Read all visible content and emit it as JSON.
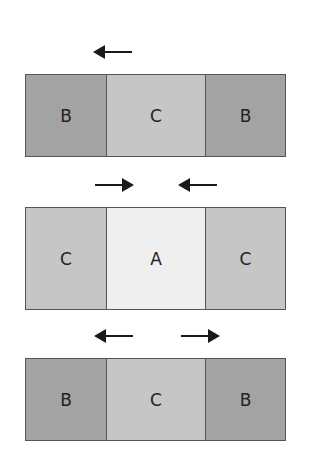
{
  "diagram": {
    "colors": {
      "A": "#efefef",
      "B": "#a3a3a3",
      "C": "#c6c6c6",
      "border": "#555555",
      "arrow": "#1a1a1a"
    },
    "rows": [
      {
        "arrows": [
          {
            "direction": "left"
          }
        ],
        "cells": [
          {
            "label": "B"
          },
          {
            "label": "C"
          },
          {
            "label": "B"
          }
        ]
      },
      {
        "arrows": [
          {
            "direction": "right"
          },
          {
            "direction": "left"
          }
        ],
        "cells": [
          {
            "label": "C"
          },
          {
            "label": "A"
          },
          {
            "label": "C"
          }
        ]
      },
      {
        "arrows": [
          {
            "direction": "left"
          },
          {
            "direction": "right"
          }
        ],
        "cells": [
          {
            "label": "B"
          },
          {
            "label": "C"
          },
          {
            "label": "B"
          }
        ]
      }
    ]
  }
}
